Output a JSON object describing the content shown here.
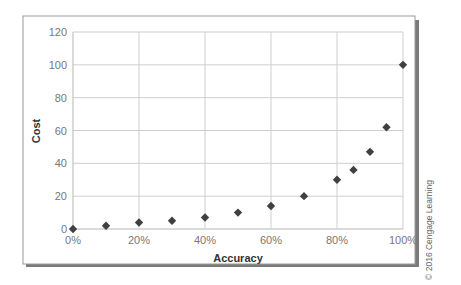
{
  "chart_data": {
    "type": "scatter",
    "title": "",
    "xlabel": "Accuracy",
    "ylabel": "Cost",
    "x": [
      0,
      10,
      20,
      30,
      40,
      50,
      60,
      70,
      80,
      85,
      90,
      95,
      100
    ],
    "y": [
      0,
      2,
      4,
      5,
      7,
      10,
      14,
      20,
      30,
      36,
      47,
      62,
      100
    ],
    "xlim": [
      0,
      100
    ],
    "ylim": [
      0,
      120
    ],
    "x_ticks": [
      "0%",
      "20%",
      "40%",
      "60%",
      "80%",
      "100%"
    ],
    "y_ticks": [
      "0",
      "20",
      "40",
      "60",
      "80",
      "100",
      "120"
    ],
    "grid": true,
    "legend": null,
    "marker": "diamond",
    "marker_color": "#404040"
  },
  "annotations": {
    "copyright": "© 2016 Cengage Learning"
  },
  "colors": {
    "grid": "#cfcfcf",
    "frame_border": "#999999",
    "frame_shadow": "#7a7a7a",
    "marker": "#404040"
  }
}
